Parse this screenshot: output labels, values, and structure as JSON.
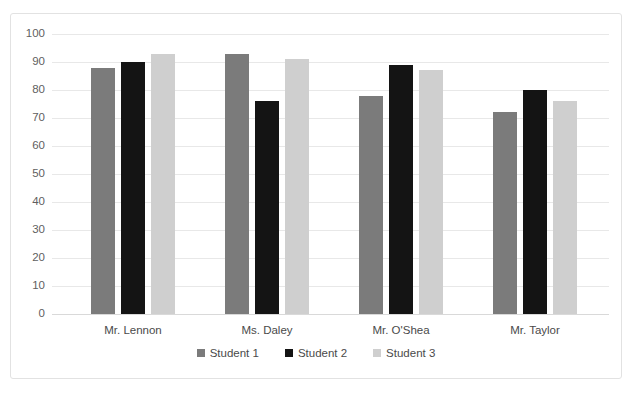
{
  "chart_data": {
    "type": "bar",
    "title": "",
    "xlabel": "",
    "ylabel": "",
    "ylim": [
      0,
      100
    ],
    "ytick_step": 10,
    "yticks": [
      100,
      90,
      80,
      70,
      60,
      50,
      40,
      30,
      20,
      10,
      0
    ],
    "grid": true,
    "legend_position": "bottom",
    "categories": [
      "Mr. Lennon",
      "Ms. Daley",
      "Mr. O'Shea",
      "Mr. Taylor"
    ],
    "series": [
      {
        "name": "Student 1",
        "color": "#7b7b7b",
        "values": [
          88,
          93,
          78,
          72
        ]
      },
      {
        "name": "Student 2",
        "color": "#141414",
        "values": [
          90,
          76,
          89,
          80
        ]
      },
      {
        "name": "Student 3",
        "color": "#cfcfcf",
        "values": [
          93,
          91,
          87,
          76
        ]
      }
    ]
  },
  "frame": {
    "border_color": "#e2e2e2",
    "background": "#ffffff"
  },
  "axis": {
    "gridline_color": "#e8e8e8",
    "baseline_color": "#d9d9d9",
    "tick_label_color": "#5f5f5f"
  }
}
